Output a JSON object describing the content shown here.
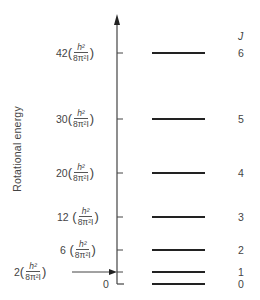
{
  "diagram": {
    "y_axis_label": "Rotational energy",
    "j_header": "J",
    "unit_numerator": "h²",
    "unit_denominator": "8π²I",
    "zero_label": "0",
    "levels": [
      {
        "J": "0",
        "coefficient": "0",
        "y": 284
      },
      {
        "J": "1",
        "coefficient": "2",
        "y": 272
      },
      {
        "J": "2",
        "coefficient": "6",
        "y": 250
      },
      {
        "J": "3",
        "coefficient": "12",
        "y": 217
      },
      {
        "J": "4",
        "coefficient": "20",
        "y": 173
      },
      {
        "J": "5",
        "coefficient": "30",
        "y": 119
      },
      {
        "J": "6",
        "coefficient": "42",
        "y": 53
      }
    ]
  }
}
